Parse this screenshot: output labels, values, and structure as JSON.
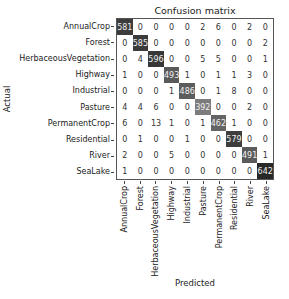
{
  "chart_data": {
    "type": "heatmap",
    "title": "Confusion matrix",
    "xlabel": "Predicted",
    "ylabel": "Actual",
    "colormap": "greys",
    "classes": [
      "AnnualCrop",
      "Forest",
      "HerbaceousVegetation",
      "Highway",
      "Industrial",
      "Pasture",
      "PermanentCrop",
      "Residential",
      "River",
      "SeaLake"
    ],
    "matrix": [
      [
        581,
        0,
        0,
        0,
        0,
        2,
        6,
        0,
        2,
        0
      ],
      [
        0,
        585,
        0,
        0,
        0,
        0,
        0,
        0,
        0,
        2
      ],
      [
        0,
        4,
        596,
        0,
        0,
        5,
        5,
        0,
        0,
        1
      ],
      [
        1,
        0,
        0,
        493,
        1,
        0,
        1,
        1,
        3,
        0
      ],
      [
        0,
        0,
        0,
        1,
        486,
        0,
        1,
        8,
        0,
        0
      ],
      [
        4,
        4,
        6,
        0,
        0,
        392,
        0,
        0,
        2,
        0
      ],
      [
        6,
        0,
        13,
        1,
        0,
        1,
        462,
        1,
        0,
        0
      ],
      [
        0,
        1,
        0,
        0,
        1,
        0,
        0,
        579,
        0,
        0
      ],
      [
        2,
        0,
        0,
        5,
        0,
        0,
        0,
        0,
        491,
        1
      ],
      [
        1,
        0,
        0,
        0,
        0,
        0,
        0,
        0,
        0,
        642
      ]
    ],
    "vmin": 0,
    "vmax": 642
  }
}
